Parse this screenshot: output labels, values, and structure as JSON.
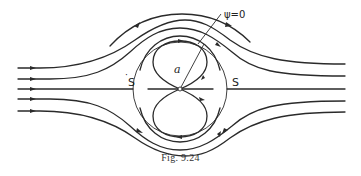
{
  "figure": {
    "caption": "Fig. 9.24",
    "labels": {
      "psi": "ψ=0",
      "radius": "a",
      "stagnation_left": "S",
      "stagnation_right": "S",
      "stagnation_left_dot": "·"
    }
  },
  "colors": {
    "ink": "#2a2a2a",
    "background": "#ffffff"
  }
}
